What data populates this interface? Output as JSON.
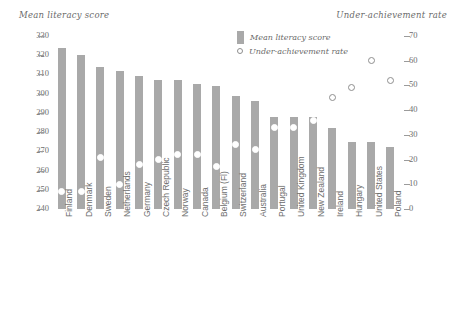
{
  "axis_titles": {
    "left": "Mean literacy score",
    "right": "Under-achievement rate"
  },
  "legend": {
    "bar_label": "Mean literacy score",
    "point_label": "Under-achievement rate",
    "bar_color": "#a9a9a9",
    "point_color": "#8e8e8e"
  },
  "chart_data": {
    "type": "bar",
    "title": "",
    "subtitle": "",
    "xlabel": "",
    "ylabel": "Mean literacy score",
    "y2label": "Under-achievement rate",
    "ylim": [
      240,
      330
    ],
    "y2lim": [
      0,
      70
    ],
    "yticks": [
      240,
      250,
      260,
      270,
      280,
      290,
      300,
      310,
      320,
      330
    ],
    "y2ticks": [
      0,
      10,
      20,
      30,
      40,
      50,
      60,
      70
    ],
    "grid": false,
    "legend_position": "top-center",
    "categories": [
      "Finland",
      "Denmark",
      "Sweden",
      "Netherlands",
      "Germany",
      "Czech Republic",
      "Norway",
      "Canada",
      "Belgium (Fl)",
      "Switzerland",
      "Australia",
      "Portugal",
      "United Kingdom",
      "New Zealand",
      "Ireland",
      "Hungary",
      "United States",
      "Poland"
    ],
    "series": [
      {
        "name": "Mean literacy score",
        "axis": "left",
        "type": "bar",
        "values": [
          324,
          320,
          314,
          312,
          309,
          307,
          307,
          305,
          304,
          299,
          296,
          288,
          288,
          288,
          282,
          275,
          275,
          272
        ]
      },
      {
        "name": "Under-achievement rate",
        "axis": "right",
        "type": "scatter",
        "values": [
          7,
          7,
          21,
          10,
          18,
          20,
          22,
          22,
          17,
          26,
          24,
          33,
          33,
          36,
          45,
          49,
          60,
          52
        ]
      }
    ]
  }
}
